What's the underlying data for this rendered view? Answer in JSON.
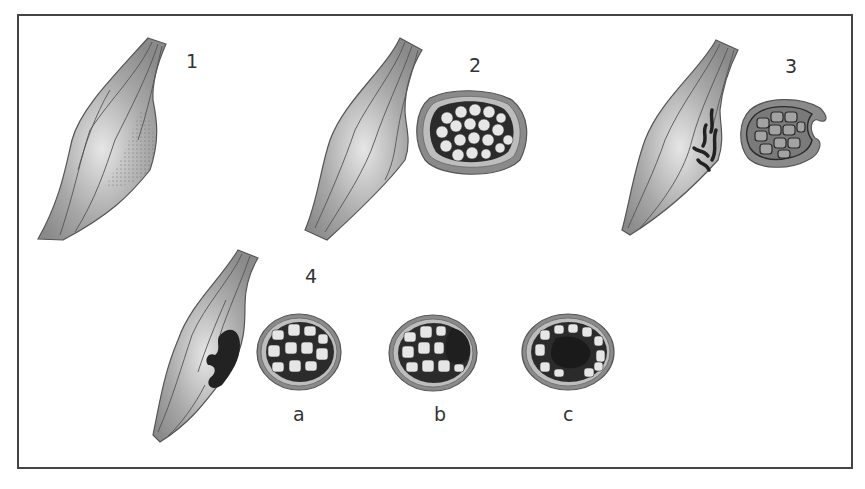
{
  "figure": {
    "panels": [
      {
        "id": "1",
        "label": "1",
        "parts": [
          "muscle"
        ],
        "feature": "stippled area (swelling)"
      },
      {
        "id": "2",
        "label": "2",
        "parts": [
          "muscle",
          "cross-section"
        ],
        "feature": "bulging muscle"
      },
      {
        "id": "3",
        "label": "3",
        "parts": [
          "muscle",
          "cross-section"
        ],
        "feature": "torn fibres / rupture"
      },
      {
        "id": "4",
        "label": "4",
        "parts": [
          "muscle",
          "cross-section a",
          "cross-section b",
          "cross-section c"
        ],
        "feature": "haematoma"
      }
    ],
    "sublabels": {
      "a": "a",
      "b": "b",
      "c": "c"
    },
    "colors": {
      "frame": "#444444",
      "muscle": "#9a9a9a",
      "haematoma": "#222222",
      "background": "#ffffff"
    }
  }
}
